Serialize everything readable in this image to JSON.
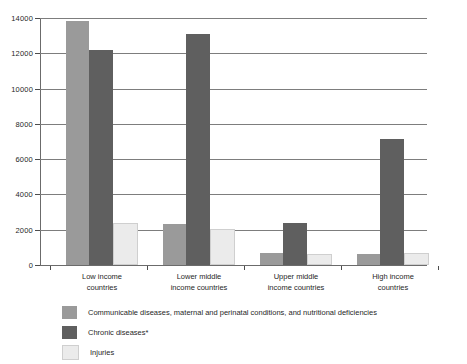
{
  "chart_data": {
    "type": "bar",
    "title": "",
    "subtitle": "",
    "xlabel": "",
    "ylabel": "",
    "ylim": [
      0,
      14000
    ],
    "ytick_step": 2000,
    "yticks": [
      0,
      2000,
      4000,
      6000,
      8000,
      10000,
      12000,
      14000
    ],
    "ytick_labels": [
      "0",
      "2000",
      "4000",
      "6000",
      "8000",
      "10000",
      "12000",
      "14000"
    ],
    "grid": true,
    "grid_axis": "y",
    "legend_position": "bottom-left",
    "grouping": "grouped",
    "categories": [
      "Low income\ncountries",
      "Lower middle\nincome countries",
      "Upper middle\nincome countries",
      "High income\ncountries"
    ],
    "series": [
      {
        "name": "Communicable diseases, maternal and perinatal conditions, and nutritional deficiencies",
        "color": "#9a9a9a",
        "values": [
          13850,
          2300,
          700,
          600
        ]
      },
      {
        "name": "Chronic diseases*",
        "color": "#5f5f5f",
        "values": [
          12200,
          13100,
          2400,
          7150
        ]
      },
      {
        "name": "Injuries",
        "color": "#ebebeb",
        "values": [
          2250,
          1950,
          500,
          550
        ]
      }
    ]
  },
  "colors": {
    "series_communicable": "#9a9a9a",
    "series_chronic": "#5f5f5f",
    "series_injuries": "#ebebeb",
    "gridline": "#7d7d7d",
    "axis": "#6b6b6b",
    "text": "#1f1f1f",
    "background": "#ffffff"
  },
  "legend": {
    "items": [
      {
        "label": "Communicable diseases, maternal and perinatal conditions, and nutritional deficiencies",
        "color": "#9a9a9a"
      },
      {
        "label": "Chronic diseases*",
        "color": "#5f5f5f"
      },
      {
        "label": "Injuries",
        "color": "#ebebeb"
      }
    ]
  }
}
